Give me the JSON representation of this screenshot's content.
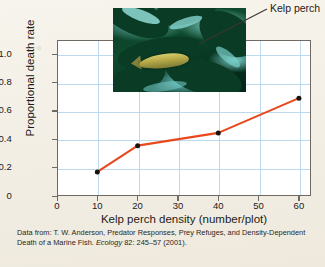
{
  "figure": {
    "background_color": "#f4f0e7",
    "annotation": {
      "label": "Kelp perch",
      "target": "photo-inset"
    },
    "photo": {
      "name": "kelp-perch-photo",
      "alt": "Kelp perch fish among dark green kelp blades in teal water"
    },
    "caption": {
      "line1_pre": "Data from: T. W. Anderson, Predator Responses, Prey Refuges, and Density-Dependent Death of a Marine Fish. ",
      "journal": "Ecology",
      "line1_post": " 82: 245–57 (2001)."
    }
  },
  "chart_data": {
    "type": "line",
    "title": "",
    "xlabel": "Kelp perch density (number/plot)",
    "ylabel": "Proportional death rate",
    "x": [
      10,
      20,
      40,
      60
    ],
    "values": [
      0.17,
      0.355,
      0.445,
      0.69
    ],
    "series": [
      {
        "name": "Proportional death rate",
        "x": [
          10,
          20,
          40,
          60
        ],
        "values": [
          0.17,
          0.355,
          0.445,
          0.69
        ],
        "line_color": "#e8481c",
        "marker_color": "#16120e",
        "marker": "circle"
      }
    ],
    "xlim": [
      0,
      63
    ],
    "ylim": [
      0,
      1.1
    ],
    "xticks": [
      0,
      10,
      20,
      30,
      40,
      50,
      60
    ],
    "xtick_labels": [
      "0",
      "10",
      "20",
      "30",
      "40",
      "50",
      "60"
    ],
    "yticks": [
      0,
      0.2,
      0.4,
      0.6,
      0.8,
      1.0
    ],
    "ytick_labels": [
      "0",
      "0.2",
      "0.4",
      "0.6",
      "0.8",
      "1.0"
    ],
    "grid": true,
    "grid_color": "#bcd9ee",
    "legend": "none",
    "frame_color": "#6e6a63",
    "plot_background": "#ffffff"
  }
}
